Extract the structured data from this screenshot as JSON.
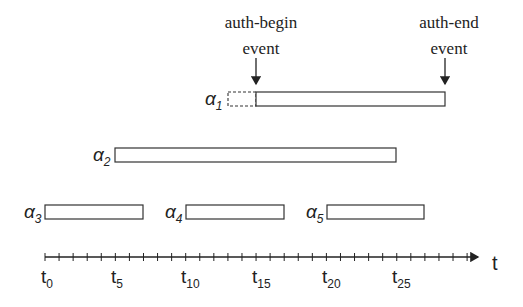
{
  "diagram": {
    "annotations": [
      {
        "id": "auth-begin",
        "line1": "auth-begin",
        "line2": "event",
        "x": 256
      },
      {
        "id": "auth-end",
        "line1": "auth-end",
        "line2": "event",
        "x": 445
      }
    ],
    "axis": {
      "label": "t",
      "start_units": 0,
      "end_units": 30,
      "tick_labels": [
        {
          "base": "t",
          "sub": "0",
          "unit": 0
        },
        {
          "base": "t",
          "sub": "5",
          "unit": 5
        },
        {
          "base": "t",
          "sub": "10",
          "unit": 10
        },
        {
          "base": "t",
          "sub": "15",
          "unit": 15
        },
        {
          "base": "t",
          "sub": "20",
          "unit": 20
        },
        {
          "base": "t",
          "sub": "25",
          "unit": 25
        }
      ]
    },
    "intervals": [
      {
        "name": "a1",
        "label_base": "α",
        "label_sub": "1",
        "start": 15,
        "end": 28.5,
        "dashed_prefix_start": 13,
        "row": 0
      },
      {
        "name": "a2",
        "label_base": "α",
        "label_sub": "2",
        "start": 5,
        "end": 25,
        "row": 1
      },
      {
        "name": "a3",
        "label_base": "α",
        "label_sub": "3",
        "start": 0,
        "end": 7,
        "row": 2
      },
      {
        "name": "a4",
        "label_base": "α",
        "label_sub": "4",
        "start": 10,
        "end": 17,
        "row": 2
      },
      {
        "name": "a5",
        "label_base": "α",
        "label_sub": "5",
        "start": 20,
        "end": 27,
        "row": 2
      }
    ]
  }
}
